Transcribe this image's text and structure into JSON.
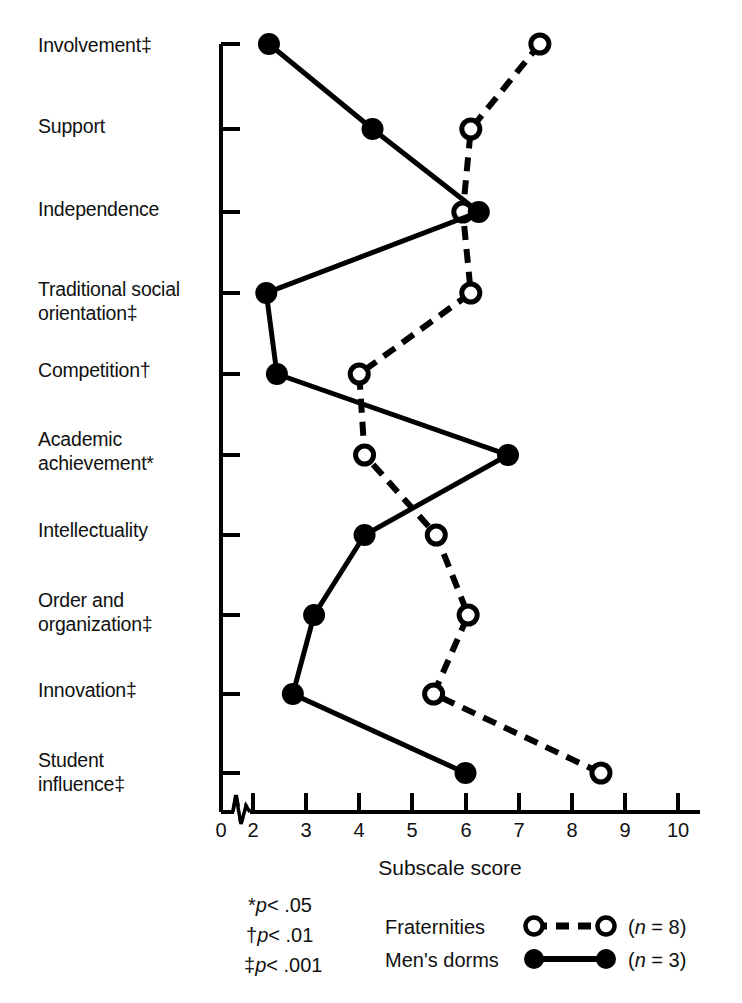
{
  "chart_data": {
    "type": "line",
    "title": "",
    "xlabel": "Subscale score",
    "ylabel": "",
    "xlim": [
      0,
      10
    ],
    "axis_break": true,
    "axis_break_between": [
      0,
      2
    ],
    "grid": false,
    "orientation": "horizontal-categories-on-y",
    "xticks": [
      "0",
      "2",
      "3",
      "4",
      "5",
      "6",
      "7",
      "8",
      "9",
      "10"
    ],
    "xtick_values": [
      0,
      2,
      3,
      4,
      5,
      6,
      7,
      8,
      9,
      10
    ],
    "categories": [
      "Involvement‡",
      "Support",
      "Independence",
      "Traditional social\norientation‡",
      "Competition†",
      "Academic\nachievement*",
      "Intellectuality",
      "Order and\norganization‡",
      "Innovation‡",
      "Student\ninfluence‡"
    ],
    "series": [
      {
        "name": "Fraternities",
        "marker": "open-circle",
        "line": "dashed",
        "color": "#000000",
        "values": [
          7.4,
          6.1,
          5.95,
          6.1,
          4.0,
          4.1,
          5.45,
          6.05,
          5.4,
          8.55
        ]
      },
      {
        "name": "Men's dorms",
        "marker": "filled-circle",
        "line": "solid",
        "color": "#000000",
        "values": [
          2.3,
          4.25,
          6.25,
          2.25,
          2.45,
          6.8,
          4.1,
          3.15,
          2.75,
          6.0
        ]
      }
    ],
    "legend": {
      "position": "bottom",
      "entries": [
        {
          "label": "Fraternities",
          "n": "(n = 8)",
          "marker": "open-circle",
          "line": "dashed"
        },
        {
          "label": "Men's dorms",
          "n": "(n = 3)",
          "marker": "filled-circle",
          "line": "solid"
        }
      ]
    },
    "footnotes": [
      {
        "symbol": "*",
        "text": "p< .05"
      },
      {
        "symbol": "†",
        "text": "p< .01"
      },
      {
        "symbol": "‡",
        "text": "p< .001"
      }
    ]
  },
  "labels": {
    "cat0": "Involvement‡",
    "cat1": "Support",
    "cat2": "Independence",
    "cat3": "Traditional social\norientation‡",
    "cat4": "Competition†",
    "cat5": "Academic\nachievement*",
    "cat6": "Intellectuality",
    "cat7": "Order and\norganization‡",
    "cat8": "Innovation‡",
    "cat9": "Student\ninfluence‡"
  },
  "xaxis": {
    "t0": "0",
    "t2": "2",
    "t3": "3",
    "t4": "4",
    "t5": "5",
    "t6": "6",
    "t7": "7",
    "t8": "8",
    "t9": "9",
    "t10": "10",
    "title": "Subscale score"
  },
  "footnotes": {
    "f1_sym": "*",
    "f1_p": "p",
    "f1_rest": "< .05",
    "f2_sym": "†",
    "f2_p": "p",
    "f2_rest": "< .01",
    "f3_sym": "‡",
    "f3_p": "p",
    "f3_rest": "< .001"
  },
  "legend": {
    "row1_label": "Fraternities",
    "row1_n_open": "(",
    "row1_n_var": "n",
    "row1_n_rest": " = 8)",
    "row2_label": "Men's dorms",
    "row2_n_open": "(",
    "row2_n_var": "n",
    "row2_n_rest": " = 3)"
  }
}
